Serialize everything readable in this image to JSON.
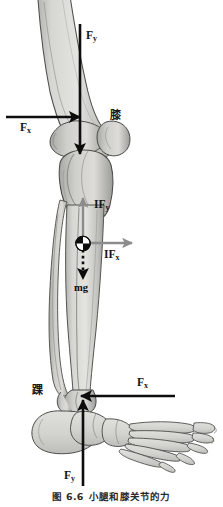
{
  "figure": {
    "caption_label": "图 6.6",
    "caption_text": "小腿和膝关节的力",
    "caption_full": "图 6.6　小腿和膝关节的力",
    "background_color": "#ffffff",
    "ink_color": "#111111",
    "bone_fill": "#d8d8d4",
    "bone_shade": "#9b9b97",
    "bone_outline": "#4a4a48",
    "arrow_color": "#0d0d0d",
    "internal_arrow_color": "#8a8a8a"
  },
  "labels": {
    "knee": "膝",
    "ankle": "踝"
  },
  "forces": [
    {
      "id": "knee-fy",
      "symbol": "F",
      "subscript": "y",
      "display": "Fy",
      "location": "knee",
      "direction": "down",
      "style": "solid-black",
      "description": "Vertical reaction force at the knee joint, pointing downward"
    },
    {
      "id": "knee-fx",
      "symbol": "F",
      "subscript": "x",
      "display": "Fx",
      "location": "knee",
      "direction": "right",
      "style": "solid-black",
      "description": "Horizontal reaction force at the knee joint, pointing to the right"
    },
    {
      "id": "com-ify",
      "symbol": "IF",
      "subscript": "y",
      "display": "IFy",
      "location": "center-of-mass",
      "direction": "up",
      "style": "solid-gray",
      "description": "Vertical inertial force at the center of mass of the lower leg, pointing upward"
    },
    {
      "id": "com-ifx",
      "symbol": "IF",
      "subscript": "x",
      "display": "IFx",
      "location": "center-of-mass",
      "direction": "right",
      "style": "solid-gray",
      "description": "Horizontal inertial force at the center of mass of the lower leg, pointing to the right"
    },
    {
      "id": "com-mg",
      "symbol": "mg",
      "subscript": "",
      "display": "mg",
      "location": "center-of-mass",
      "direction": "down",
      "style": "dashed-black",
      "description": "Weight of the lower leg acting downward at the center of mass"
    },
    {
      "id": "ankle-fx",
      "symbol": "F",
      "subscript": "x",
      "display": "Fx",
      "location": "ankle",
      "direction": "left",
      "style": "solid-black",
      "description": "Horizontal reaction force at the ankle joint, pointing to the left"
    },
    {
      "id": "ankle-fy",
      "symbol": "F",
      "subscript": "y",
      "display": "Fy",
      "location": "ankle",
      "direction": "up",
      "style": "solid-black",
      "description": "Vertical reaction force at the ankle joint, pointing upward"
    }
  ],
  "markers": [
    {
      "id": "center-of-mass",
      "name": "center-of-mass-symbol",
      "description": "Quartered black-and-white circle marking the center of mass of the lower leg"
    }
  ],
  "anatomy": [
    {
      "id": "femur",
      "name": "femur"
    },
    {
      "id": "patella",
      "name": "patella"
    },
    {
      "id": "tibia",
      "name": "tibia"
    },
    {
      "id": "fibula",
      "name": "fibula"
    },
    {
      "id": "foot",
      "name": "foot-skeleton"
    }
  ]
}
